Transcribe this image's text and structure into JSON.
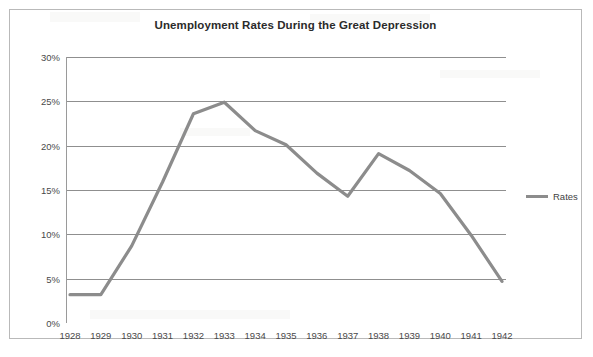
{
  "chart_data": {
    "type": "line",
    "title": "Unemployment Rates During the Great Depression",
    "xlabel": "",
    "ylabel": "",
    "grid": true,
    "legend_position": "right",
    "categories": [
      "1928",
      "1929",
      "1930",
      "1931",
      "1932",
      "1933",
      "1934",
      "1935",
      "1936",
      "1937",
      "1938",
      "1939",
      "1940",
      "1941",
      "1942"
    ],
    "ylim": [
      0,
      30
    ],
    "ytick_labels": [
      "0%",
      "5%",
      "10%",
      "15%",
      "20%",
      "25%",
      "30%"
    ],
    "ytick_values": [
      0,
      5,
      10,
      15,
      20,
      25,
      30
    ],
    "series": [
      {
        "name": "Rates",
        "color": "#8c8c8c",
        "values": [
          3.2,
          3.2,
          8.7,
          15.9,
          23.6,
          24.9,
          21.7,
          20.1,
          16.9,
          14.3,
          19.1,
          17.2,
          14.6,
          9.9,
          4.7
        ]
      }
    ]
  },
  "legend": {
    "entries": [
      {
        "label": "Rates"
      }
    ]
  }
}
